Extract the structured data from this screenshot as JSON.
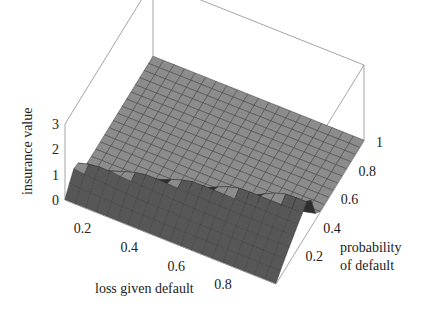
{
  "chart_data": {
    "type": "surface3d",
    "title": "",
    "xlabel": "loss given default",
    "ylabel_lines": [
      "probability",
      "of default"
    ],
    "zlabel": "insurance value",
    "x_ticks": [
      "0.2",
      "0.4",
      "0.6",
      "0.8"
    ],
    "x_tick_values": [
      0.2,
      0.4,
      0.6,
      0.8
    ],
    "y_ticks": [
      "0.2",
      "0.4",
      "0.6",
      "0.8",
      "1"
    ],
    "y_tick_values": [
      0.2,
      0.4,
      0.6,
      0.8,
      1.0
    ],
    "z_ticks": [
      "0",
      "1",
      "2",
      "3"
    ],
    "z_tick_values": [
      0,
      1,
      2,
      3
    ],
    "xlim": [
      0.1,
      1.0
    ],
    "ylim": [
      0.0,
      1.0
    ],
    "zlim": [
      0,
      3
    ],
    "grid_x_count": 20,
    "grid_y_count": 20,
    "surface_description": "Surface is near 0 across most of the domain; rises along the low probability-of-default edge to a ridge peaking around 1 near loss given default ≈ 1 and probability of default ≈ 0.35, and about 0.8 at loss given default ≈ 0.1 and probability of default ≈ 0.15.",
    "sample_points": [
      {
        "x": 0.1,
        "y": 0.0,
        "z": 0.0
      },
      {
        "x": 0.1,
        "y": 0.15,
        "z": 0.8
      },
      {
        "x": 0.5,
        "y": 0.2,
        "z": 0.9
      },
      {
        "x": 1.0,
        "y": 0.35,
        "z": 1.3
      },
      {
        "x": 1.0,
        "y": 0.45,
        "z": 0.0
      },
      {
        "x": 0.5,
        "y": 0.6,
        "z": 0.05
      },
      {
        "x": 1.0,
        "y": 1.0,
        "z": 0.0
      }
    ],
    "colors": {
      "top_surface": "#8c8c8c",
      "front_surface": "#575757",
      "mesh": "#3a3a3a",
      "box": "#9a9a9a"
    }
  }
}
